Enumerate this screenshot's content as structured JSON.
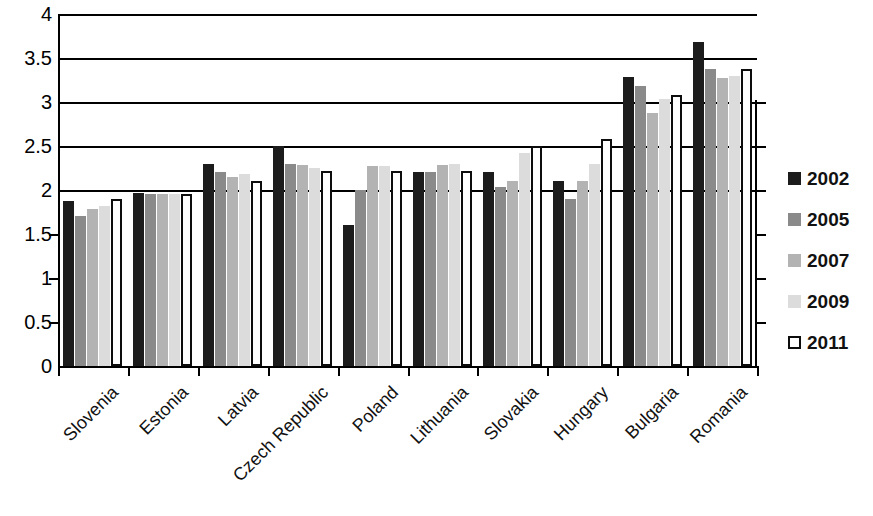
{
  "chart_data": {
    "type": "bar",
    "title": "",
    "subtitle": "",
    "xlabel": "",
    "ylabel": "",
    "ylim": [
      0,
      4
    ],
    "ytick_labels": [
      "0",
      "0.5",
      "1",
      "1.5",
      "2",
      "2.5",
      "3",
      "3.5",
      "4"
    ],
    "ytick_values": [
      0,
      0.5,
      1,
      1.5,
      2,
      2.5,
      3,
      3.5,
      4
    ],
    "grid": "horizontal-above-2",
    "gridline_values": [
      2,
      2.5,
      3,
      3.5,
      4
    ],
    "legend_position": "right",
    "categories": [
      "Slovenia",
      "Estonia",
      "Latvia",
      "Czech Republic",
      "Poland",
      "Lithuania",
      "Slovakia",
      "Hungary",
      "Bulgaria",
      "Romania"
    ],
    "series": [
      {
        "name": "2002",
        "color": "#1c1c1c",
        "values": [
          1.88,
          1.97,
          2.3,
          2.5,
          1.6,
          2.2,
          2.2,
          2.1,
          3.28,
          3.68
        ]
      },
      {
        "name": "2005",
        "color": "#8a8a8a",
        "values": [
          1.7,
          1.95,
          2.2,
          2.3,
          2.0,
          2.2,
          2.03,
          1.9,
          3.18,
          3.37
        ]
      },
      {
        "name": "2007",
        "color": "#b3b3b3",
        "values": [
          1.78,
          1.95,
          2.15,
          2.28,
          2.27,
          2.28,
          2.1,
          2.1,
          2.88,
          3.27
        ]
      },
      {
        "name": "2009",
        "color": "#dcdcdc",
        "values": [
          1.82,
          1.95,
          2.18,
          2.25,
          2.27,
          2.3,
          2.42,
          2.3,
          3.03,
          3.3
        ]
      },
      {
        "name": "2011",
        "color": "#ffffff",
        "values": [
          1.9,
          1.95,
          2.1,
          2.22,
          2.22,
          2.22,
          2.5,
          2.58,
          3.08,
          3.38
        ]
      }
    ]
  },
  "legend": {
    "items": [
      {
        "label": "2002",
        "swatch": "s2002"
      },
      {
        "label": "2005",
        "swatch": "s2005"
      },
      {
        "label": "2007",
        "swatch": "s2007"
      },
      {
        "label": "2009",
        "swatch": "s2009"
      },
      {
        "label": "2011",
        "swatch": "s2011"
      }
    ]
  }
}
